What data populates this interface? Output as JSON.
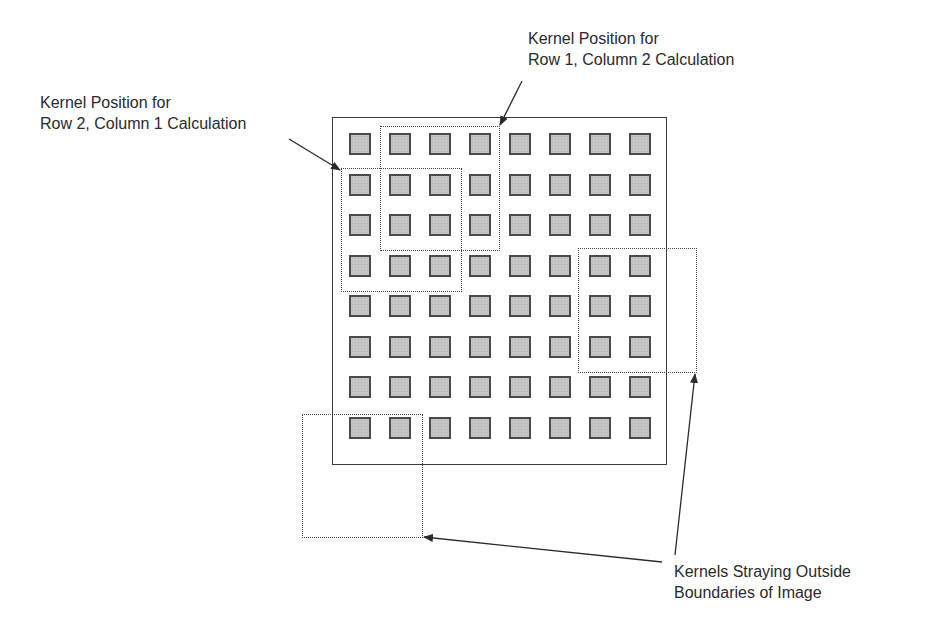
{
  "diagram": {
    "grid": {
      "rows": 8,
      "cols": 8
    },
    "labels": {
      "row2_col1": {
        "line1": "Kernel Position for",
        "line2": "Row 2, Column 1 Calculation"
      },
      "row1_col2": {
        "line1": "Kernel Position for",
        "line2": "Row 1, Column 2 Calculation"
      },
      "stray": {
        "line1": "Kernels Straying Outside",
        "line2": "Boundaries of Image"
      }
    },
    "kernels": [
      {
        "name": "kernel-row1-col2",
        "size": "3x3"
      },
      {
        "name": "kernel-row2-col1",
        "size": "3x3"
      },
      {
        "name": "kernel-stray-right",
        "size": "3x3"
      },
      {
        "name": "kernel-stray-bottom-left",
        "size": "3x3"
      }
    ],
    "colors": {
      "pixel_fill": "#c6c6c6",
      "pixel_border": "#4a4a4a",
      "line": "#3a3a3a"
    }
  }
}
